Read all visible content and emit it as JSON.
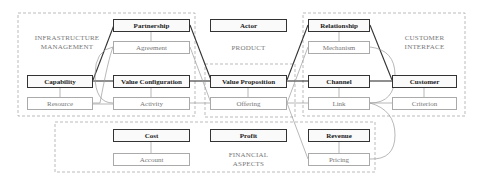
{
  "areas": {
    "infrastructure": "INFRASTRUCTURE\nMANAGEMENT",
    "infrastructure_l1": "INFRASTRUCTURE",
    "infrastructure_l2": "MANAGEMENT",
    "product": "PRODUCT",
    "customer_l1": "CUSTOMER",
    "customer_l2": "INTERFACE",
    "financial_l1": "FINANCIAL",
    "financial_l2": "ASPECTS"
  },
  "nodes": {
    "partnership": "Partnership",
    "agreement": "Agreement",
    "actor": "Actor",
    "relationship": "Relationship",
    "mechanism": "Mechanism",
    "capability": "Capability",
    "resource": "Resource",
    "value_configuration": "Value Configuration",
    "activity": "Activity",
    "value_proposition": "Value Proposition",
    "offering": "Offering",
    "channel": "Channel",
    "link": "Link",
    "customer": "Customer",
    "criterion": "Criterion",
    "cost": "Cost",
    "account": "Account",
    "profit": "Profit",
    "revenue": "Revenue",
    "pricing": "Pricing"
  },
  "colors": {
    "main_border": "#333333",
    "sub_border": "#aaaaaa",
    "dashed": "#aaaaaa",
    "connector": "#999999"
  }
}
